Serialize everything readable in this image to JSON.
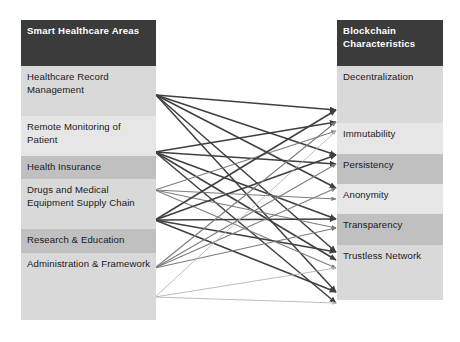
{
  "diagram": {
    "type": "bipartite-mapping"
  },
  "left_column": {
    "header": "Smart Healthcare Areas",
    "nodes": [
      {
        "id": "hrm",
        "label": "Healthcare Record Management",
        "tone": "light"
      },
      {
        "id": "rmp",
        "label": "Remote Monitoring of Patient",
        "tone": "pale"
      },
      {
        "id": "hi",
        "label": "Health Insurance",
        "tone": "mid"
      },
      {
        "id": "dmesc",
        "label": "Drugs and Medical Equipment Supply Chain",
        "tone": "light"
      },
      {
        "id": "re",
        "label": "Research & Education",
        "tone": "mid"
      },
      {
        "id": "af",
        "label": "Administration & Framework",
        "tone": "light"
      }
    ]
  },
  "right_column": {
    "header": "Blockchain Characteristics",
    "nodes": [
      {
        "id": "dec",
        "label": "Decentralization",
        "tone": "light"
      },
      {
        "id": "imm",
        "label": "Immutability",
        "tone": "pale"
      },
      {
        "id": "per",
        "label": "Persistency",
        "tone": "mid"
      },
      {
        "id": "ano",
        "label": "Anonymity",
        "tone": "pale"
      },
      {
        "id": "tra",
        "label": "Transparency",
        "tone": "mid"
      },
      {
        "id": "trn",
        "label": "Trustless Network",
        "tone": "light"
      }
    ]
  },
  "chart_data": {
    "type": "diagram",
    "left_nodes": [
      "Healthcare Record Management",
      "Remote Monitoring of Patient",
      "Health Insurance",
      "Drugs and Medical Equipment Supply Chain",
      "Research & Education",
      "Administration & Framework"
    ],
    "right_nodes": [
      "Decentralization",
      "Immutability",
      "Persistency",
      "Anonymity",
      "Transparency",
      "Trustless Network"
    ],
    "source_anchors": [
      {
        "id": "hrm",
        "x": 156,
        "y": 95
      },
      {
        "id": "rmp",
        "x": 155,
        "y": 152
      },
      {
        "id": "hi",
        "x": 155,
        "y": 190
      },
      {
        "id": "dmesc",
        "x": 155,
        "y": 220
      },
      {
        "id": "re",
        "x": 155,
        "y": 268
      },
      {
        "id": "af",
        "x": 155,
        "y": 297
      }
    ],
    "target_anchors": [
      {
        "id": "dec-1",
        "x": 336,
        "y": 110
      },
      {
        "id": "dec-2",
        "x": 336,
        "y": 122
      },
      {
        "id": "dec-3",
        "x": 336,
        "y": 131
      },
      {
        "id": "imm-1",
        "x": 336,
        "y": 155
      },
      {
        "id": "imm-2",
        "x": 336,
        "y": 164
      },
      {
        "id": "per-1",
        "x": 336,
        "y": 188
      },
      {
        "id": "per-2",
        "x": 336,
        "y": 199
      },
      {
        "id": "ano-1",
        "x": 336,
        "y": 219
      },
      {
        "id": "ano-2",
        "x": 336,
        "y": 228
      },
      {
        "id": "tra-1",
        "x": 336,
        "y": 252
      },
      {
        "id": "tra-2",
        "x": 336,
        "y": 260
      },
      {
        "id": "tra-3",
        "x": 336,
        "y": 268
      },
      {
        "id": "trn-1",
        "x": 336,
        "y": 292
      },
      {
        "id": "trn-2",
        "x": 336,
        "y": 303
      }
    ],
    "edges": [
      {
        "from": "hrm",
        "to": "dec-1",
        "shade": "dark"
      },
      {
        "from": "hrm",
        "to": "imm-1",
        "shade": "dark"
      },
      {
        "from": "hrm",
        "to": "per-1",
        "shade": "dark"
      },
      {
        "from": "hrm",
        "to": "tra-1",
        "shade": "dark"
      },
      {
        "from": "hrm",
        "to": "trn-1",
        "shade": "dark"
      },
      {
        "from": "rmp",
        "to": "dec-2",
        "shade": "dark"
      },
      {
        "from": "rmp",
        "to": "imm-2",
        "shade": "dark"
      },
      {
        "from": "rmp",
        "to": "ano-1",
        "shade": "dark"
      },
      {
        "from": "rmp",
        "to": "tra-2",
        "shade": "dark"
      },
      {
        "from": "rmp",
        "to": "trn-2",
        "shade": "dark"
      },
      {
        "from": "hi",
        "to": "dec-3",
        "shade": "mid"
      },
      {
        "from": "hi",
        "to": "per-2",
        "shade": "mid"
      },
      {
        "from": "hi",
        "to": "ano-2",
        "shade": "mid"
      },
      {
        "from": "hi",
        "to": "tra-3",
        "shade": "mid"
      },
      {
        "from": "dmesc",
        "to": "dec-1",
        "shade": "dark"
      },
      {
        "from": "dmesc",
        "to": "imm-1",
        "shade": "dark"
      },
      {
        "from": "dmesc",
        "to": "ano-1",
        "shade": "dark"
      },
      {
        "from": "dmesc",
        "to": "tra-1",
        "shade": "dark"
      },
      {
        "from": "dmesc",
        "to": "trn-1",
        "shade": "dark"
      },
      {
        "from": "re",
        "to": "dec-2",
        "shade": "mid"
      },
      {
        "from": "re",
        "to": "imm-2",
        "shade": "mid"
      },
      {
        "from": "re",
        "to": "per-1",
        "shade": "mid"
      },
      {
        "from": "re",
        "to": "ano-2",
        "shade": "mid"
      },
      {
        "from": "af",
        "to": "dec-3",
        "shade": "light"
      },
      {
        "from": "af",
        "to": "tra-3",
        "shade": "light"
      },
      {
        "from": "af",
        "to": "trn-2",
        "shade": "light"
      }
    ],
    "edge_colors": {
      "dark": "#3f3f3f",
      "mid": "#7d7d7d",
      "light": "#b5b5b5"
    }
  }
}
